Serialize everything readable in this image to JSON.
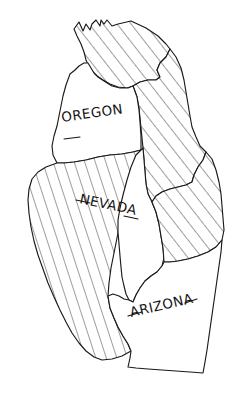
{
  "figure": {
    "type": "hand-drawn-map",
    "canvas": {
      "width": 232,
      "height": 404
    },
    "background_color": "#ffffff",
    "ink_color": "#1a1a1a",
    "style": "pen-and-ink hand-drawn, diagonal hatching on unlabeled states"
  },
  "legend": {
    "labeled_state_style": "unshaded / white interior",
    "unlabeled_state_style": "diagonal line hatching"
  },
  "labels": {
    "oregon": {
      "text": "OREGON",
      "x": 62,
      "y": 122,
      "rotation": -8,
      "underline": {
        "x1": 64,
        "y1": 139,
        "x2": 80,
        "y2": 137
      }
    },
    "nevada": {
      "text": "NEVADA",
      "x": 79,
      "y": 203,
      "rotation": 12,
      "underline_left": {
        "x1": 76,
        "y1": 200,
        "x2": 90,
        "y2": 203
      },
      "underline_right": {
        "x1": 124,
        "y1": 216,
        "x2": 138,
        "y2": 219
      }
    },
    "arizona": {
      "text": "ARIZONA",
      "x": 131,
      "y": 317,
      "rotation": -13,
      "underline_left": {
        "x1": 128,
        "y1": 316,
        "x2": 142,
        "y2": 312
      },
      "underline_right": {
        "x1": 185,
        "y1": 303,
        "x2": 197,
        "y2": 299
      }
    }
  },
  "regions": [
    {
      "id": "washington",
      "name": "Washington",
      "labeled": false,
      "hatched": true,
      "hatch_angle_deg": -38,
      "hatch_spacing_px": 9
    },
    {
      "id": "oregon",
      "name": "Oregon",
      "labeled": true,
      "hatched": false,
      "label_key": "oregon"
    },
    {
      "id": "idaho",
      "name": "Idaho",
      "labeled": false,
      "hatched": true,
      "hatch_angle_deg": -38,
      "hatch_spacing_px": 9
    },
    {
      "id": "california",
      "name": "California",
      "labeled": false,
      "hatched": true,
      "hatch_angle_deg": -18,
      "hatch_spacing_px": 9
    },
    {
      "id": "nevada",
      "name": "Nevada",
      "labeled": true,
      "hatched": false,
      "label_key": "nevada"
    },
    {
      "id": "utah",
      "name": "Utah",
      "labeled": false,
      "hatched": true,
      "hatch_angle_deg": -38,
      "hatch_spacing_px": 9
    },
    {
      "id": "arizona",
      "name": "Arizona",
      "labeled": true,
      "hatched": false,
      "label_key": "arizona"
    }
  ]
}
